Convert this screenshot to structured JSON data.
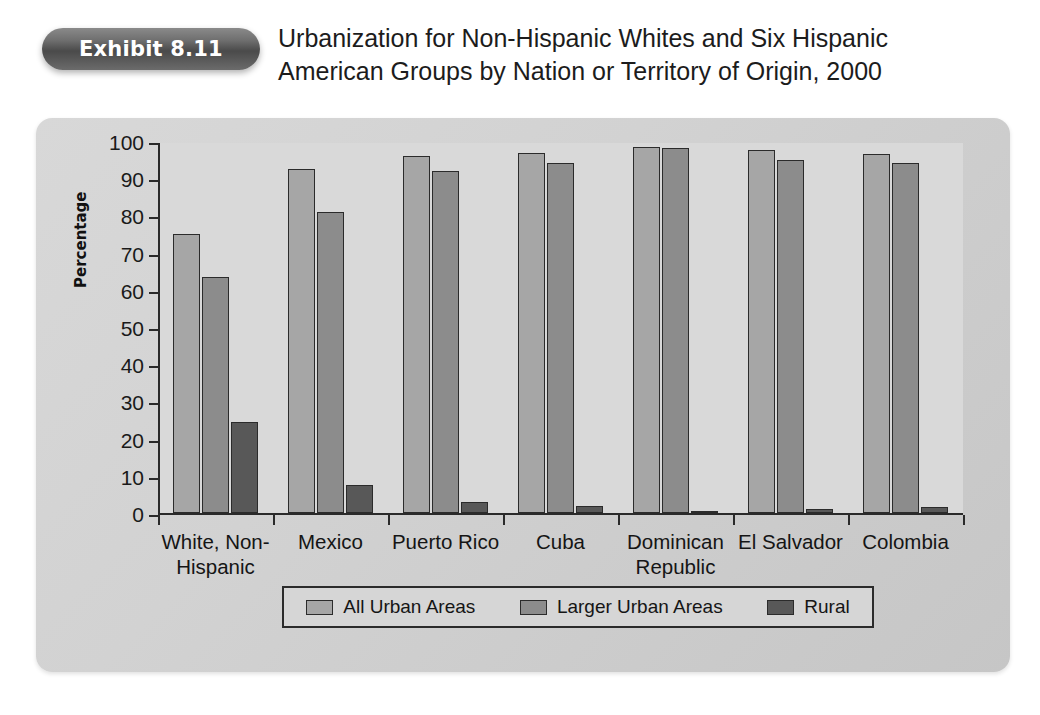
{
  "header": {
    "badge_label": "Exhibit 8.11",
    "title_line_1": "Urbanization for Non-Hispanic Whites and Six Hispanic",
    "title_line_2": "American Groups by Nation or Territory of Origin, 2000"
  },
  "chart_data": {
    "type": "bar",
    "title": "Urbanization for Non-Hispanic Whites and Six Hispanic American Groups by Nation or Territory of Origin, 2000",
    "xlabel": "",
    "ylabel": "Percentage",
    "ylim": [
      0,
      100
    ],
    "ytick_step": 10,
    "yticks": [
      100,
      90,
      80,
      70,
      60,
      50,
      40,
      30,
      20,
      10,
      0
    ],
    "grid": false,
    "legend_position": "bottom",
    "categories": [
      "White, Non-Hispanic",
      "Mexico",
      "Puerto Rico",
      "Cuba",
      "Dominican Republic",
      "El Salvador",
      "Colombia"
    ],
    "category_label_lines": [
      [
        "White, Non-",
        "Hispanic"
      ],
      [
        "Mexico"
      ],
      [
        "Puerto Rico"
      ],
      [
        "Cuba"
      ],
      [
        "Dominican",
        "Republic"
      ],
      [
        "El Salvador"
      ],
      [
        "Colombia"
      ]
    ],
    "series": [
      {
        "name": "All Urban Areas",
        "color": "#a6a6a6",
        "values": [
          75,
          92.5,
          96,
          96.8,
          98.5,
          97.5,
          96.5
        ]
      },
      {
        "name": "Larger Urban Areas",
        "color": "#8c8c8c",
        "values": [
          63.5,
          81,
          92,
          94,
          98,
          95,
          94
        ]
      },
      {
        "name": "Rural",
        "color": "#585858",
        "values": [
          24.5,
          7.5,
          3,
          2,
          0.5,
          1,
          1.5
        ]
      }
    ]
  },
  "colors": {
    "panel_background": "#d4d4d4",
    "plot_background": "#d9d9d9",
    "axis": "#2a2a2a",
    "badge": "#5a5a5a",
    "page_background": "#ffffff"
  }
}
